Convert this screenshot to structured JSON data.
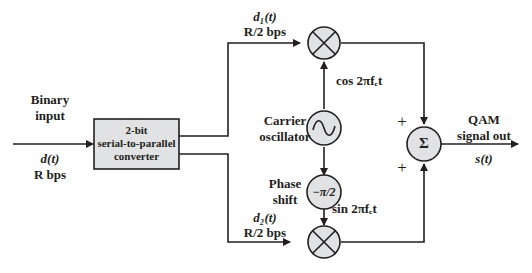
{
  "diagram": {
    "input": {
      "label_line1": "Binary",
      "label_line2": "input",
      "signal": "d(t)",
      "rate": "R bps"
    },
    "converter": {
      "line1": "2-bit",
      "line2": "serial-to-parallel",
      "line3": "converter"
    },
    "upper_branch": {
      "signal": "d₁(t)",
      "rate": "R/2 bps",
      "carrier": "cos 2πfₑt"
    },
    "lower_branch": {
      "signal": "d₂(t)",
      "rate": "R/2 bps",
      "carrier": "sin 2πfₑt"
    },
    "oscillator": {
      "line1": "Carrier",
      "line2": "oscillator",
      "symbol": "~"
    },
    "phase_shift": {
      "line1": "Phase",
      "line2": "shift",
      "value": "−π/2"
    },
    "summer": {
      "symbol": "Σ",
      "plus_top": "+",
      "plus_bottom": "+"
    },
    "output": {
      "line1": "QAM",
      "line2": "signal out",
      "signal": "s(t)"
    },
    "colors": {
      "block_fill": "#e1e2e3",
      "stroke": "#231f20"
    }
  }
}
